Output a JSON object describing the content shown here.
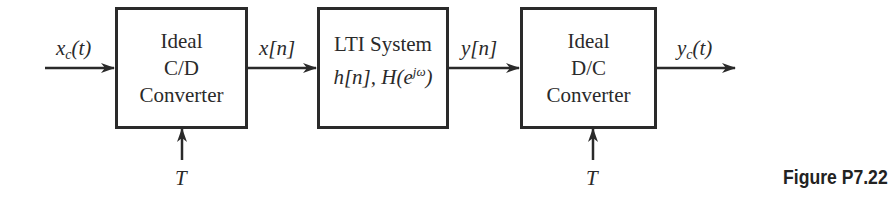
{
  "diagram": {
    "type": "block-diagram",
    "blocks": [
      {
        "id": "cd",
        "lines": [
          "Ideal",
          "C/D",
          "Converter"
        ]
      },
      {
        "id": "lti",
        "line1": "LTI System",
        "line2_h": "h[n], H(e",
        "line2_sup": "jω",
        "line2_close": ")"
      },
      {
        "id": "dc",
        "lines": [
          "Ideal",
          "D/C",
          "Converter"
        ]
      }
    ],
    "signals": {
      "input_main": "x",
      "input_sub": "c",
      "input_arg": "(t)",
      "cd_to_lti": "x[n]",
      "lti_to_dc": "y[n]",
      "output_main": "y",
      "output_sub": "c",
      "output_arg": "(t)"
    },
    "control_inputs": [
      {
        "block": "cd",
        "label": "T"
      },
      {
        "block": "dc",
        "label": "T"
      }
    ],
    "caption": "Figure P7.22",
    "colors": {
      "stroke": "#2a2a2a",
      "background": "#ffffff"
    }
  }
}
